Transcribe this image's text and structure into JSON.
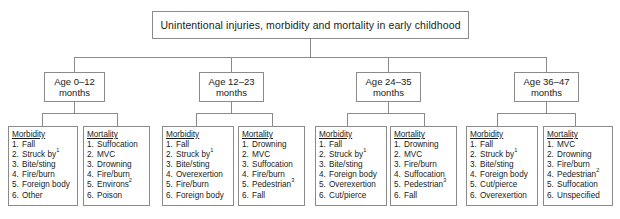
{
  "diagram": {
    "type": "tree-hierarchy",
    "root": {
      "label": "Unintentional injuries, morbidity and mortality in early childhood"
    },
    "age_groups": [
      {
        "line1": "Age 0–12",
        "line2": "months"
      },
      {
        "line1": "Age 12–23",
        "line2": "months"
      },
      {
        "line1": "Age 24–35",
        "line2": "months"
      },
      {
        "line1": "Age 36–47",
        "line2": "months"
      }
    ],
    "leaves": [
      {
        "title": "Morbidity",
        "items": [
          {
            "num": "1.",
            "text": "Fall",
            "sup": ""
          },
          {
            "num": "2.",
            "text": "Struck by",
            "sup": "1"
          },
          {
            "num": "3.",
            "text": "Bite/sting",
            "sup": ""
          },
          {
            "num": "4.",
            "text": "Fire/burn",
            "sup": ""
          },
          {
            "num": "5.",
            "text": "Foreign body",
            "sup": ""
          },
          {
            "num": "6.",
            "text": "Other",
            "sup": ""
          }
        ]
      },
      {
        "title": "Mortality",
        "items": [
          {
            "num": "1.",
            "text": "Suffocation",
            "sup": ""
          },
          {
            "num": "2.",
            "text": "MVC",
            "sup": ""
          },
          {
            "num": "3.",
            "text": "Drowning",
            "sup": ""
          },
          {
            "num": "4.",
            "text": "Fire/burn",
            "sup": ""
          },
          {
            "num": "5.",
            "text": "Environs",
            "sup": "2"
          },
          {
            "num": "6.",
            "text": "Poison",
            "sup": ""
          }
        ]
      },
      {
        "title": "Morbidity",
        "items": [
          {
            "num": "1.",
            "text": "Fall",
            "sup": ""
          },
          {
            "num": "2.",
            "text": "Struck by",
            "sup": "1"
          },
          {
            "num": "3.",
            "text": "Bite/sting",
            "sup": ""
          },
          {
            "num": "4.",
            "text": "Overexertion",
            "sup": ""
          },
          {
            "num": "5.",
            "text": "Fire/burn",
            "sup": ""
          },
          {
            "num": "6.",
            "text": "Foreign body",
            "sup": ""
          }
        ]
      },
      {
        "title": "Mortality",
        "items": [
          {
            "num": "1.",
            "text": "Drowning",
            "sup": ""
          },
          {
            "num": "2.",
            "text": "MVC",
            "sup": ""
          },
          {
            "num": "3.",
            "text": "Suffocation",
            "sup": ""
          },
          {
            "num": "4.",
            "text": "Fire/burn",
            "sup": ""
          },
          {
            "num": "5.",
            "text": "Pedestrian",
            "sup": "3"
          },
          {
            "num": "6.",
            "text": "Fall",
            "sup": ""
          }
        ]
      },
      {
        "title": "Morbidity",
        "items": [
          {
            "num": "1.",
            "text": "Fall",
            "sup": ""
          },
          {
            "num": "2.",
            "text": "Struck by",
            "sup": "1"
          },
          {
            "num": "3.",
            "text": "Bite/sting",
            "sup": ""
          },
          {
            "num": "4.",
            "text": "Foreign body",
            "sup": ""
          },
          {
            "num": "5.",
            "text": "Overexertion",
            "sup": ""
          },
          {
            "num": "6.",
            "text": "Cut/pierce",
            "sup": ""
          }
        ]
      },
      {
        "title": "Mortality",
        "items": [
          {
            "num": "1.",
            "text": "Drowning",
            "sup": ""
          },
          {
            "num": "2.",
            "text": "MVC",
            "sup": ""
          },
          {
            "num": "3.",
            "text": "Fire/burn",
            "sup": ""
          },
          {
            "num": "4.",
            "text": "Suffocation",
            "sup": ""
          },
          {
            "num": "5.",
            "text": "Pedestrian",
            "sup": "3"
          },
          {
            "num": "6.",
            "text": "Fall",
            "sup": ""
          }
        ]
      },
      {
        "title": "Morbidity",
        "items": [
          {
            "num": "1.",
            "text": "Fall",
            "sup": ""
          },
          {
            "num": "2.",
            "text": "Struck by",
            "sup": "1"
          },
          {
            "num": "3.",
            "text": "Bite/sting",
            "sup": ""
          },
          {
            "num": "4.",
            "text": "Foreign body",
            "sup": ""
          },
          {
            "num": "5.",
            "text": "Cut/pierce",
            "sup": ""
          },
          {
            "num": "6.",
            "text": "Overexertion",
            "sup": ""
          }
        ]
      },
      {
        "title": "Mortality",
        "items": [
          {
            "num": "1.",
            "text": "MVC",
            "sup": ""
          },
          {
            "num": "2.",
            "text": "Drowning",
            "sup": ""
          },
          {
            "num": "3.",
            "text": "Fire/burn",
            "sup": ""
          },
          {
            "num": "4.",
            "text": "Pedestrian",
            "sup": "2"
          },
          {
            "num": "5.",
            "text": "Suffocation",
            "sup": ""
          },
          {
            "num": "6.",
            "text": "Unspecified",
            "sup": ""
          }
        ]
      }
    ],
    "colors": {
      "border": "#8a8a8a",
      "text": "#1a1a1a",
      "background": "#ffffff"
    }
  }
}
